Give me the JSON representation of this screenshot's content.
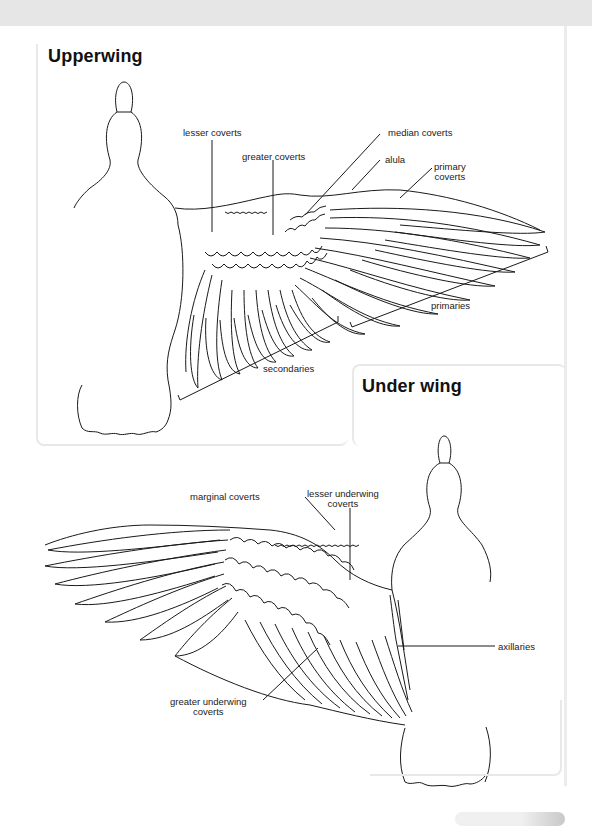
{
  "sections": {
    "upper": {
      "title": "Upperwing",
      "labels": {
        "lesser_coverts": "lesser coverts",
        "greater_coverts": "greater coverts",
        "median_coverts": "median coverts",
        "alula": "alula",
        "primary_coverts_1": "primary",
        "primary_coverts_2": "coverts",
        "primaries": "primaries",
        "secondaries": "secondaries"
      }
    },
    "under": {
      "title": "Under wing",
      "labels": {
        "marginal_coverts": "marginal coverts",
        "lesser_underwing_coverts_1": "lesser underwing",
        "lesser_underwing_coverts_2": "coverts",
        "axillaries": "axillaries",
        "greater_underwing_coverts_1": "greater underwing",
        "greater_underwing_coverts_2": "coverts"
      }
    }
  }
}
